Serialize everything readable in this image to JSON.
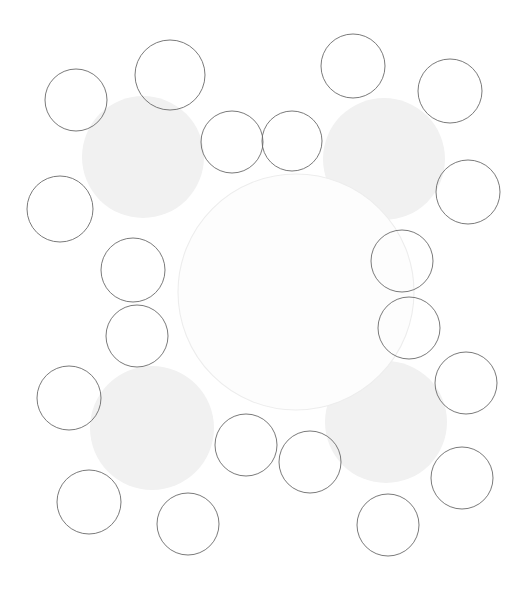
{
  "figure": {
    "type": "circle-packing-diagram",
    "width": 527,
    "height": 593,
    "background": "#ffffff",
    "stroke_color": "#6b6b6b",
    "stroke_width": 0.9,
    "fill_none": "none",
    "gray_fill": "#f1f1f1",
    "gray_stroke": "none",
    "center_stroke": "#ededed",
    "center_fill": "#fdfdfd"
  },
  "chart_data": {
    "type": "scatter",
    "title": "",
    "xlabel": "",
    "ylabel": "",
    "xlim": [
      0,
      527
    ],
    "ylim": [
      0,
      593
    ],
    "grid": false,
    "legend": null,
    "annotations": [],
    "series": [
      {
        "name": "central-circle",
        "style": "outline-faint",
        "points": [
          {
            "id": "c-center",
            "cx": 296,
            "cy": 292,
            "r": 118
          }
        ]
      },
      {
        "name": "gray-discs",
        "style": "filled-gray",
        "points": [
          {
            "id": "g-top-left",
            "cx": 143,
            "cy": 157,
            "r": 61
          },
          {
            "id": "g-top-right",
            "cx": 384,
            "cy": 159,
            "r": 61
          },
          {
            "id": "g-bottom-left",
            "cx": 152,
            "cy": 428,
            "r": 62
          },
          {
            "id": "g-bottom-right",
            "cx": 386,
            "cy": 422,
            "r": 61
          }
        ]
      },
      {
        "name": "outlined-circles",
        "style": "outline",
        "points": [
          {
            "id": "o-01",
            "cx": 76,
            "cy": 100,
            "r": 31
          },
          {
            "id": "o-02",
            "cx": 170,
            "cy": 75,
            "r": 35
          },
          {
            "id": "o-03",
            "cx": 353,
            "cy": 66,
            "r": 32
          },
          {
            "id": "o-04",
            "cx": 450,
            "cy": 91,
            "r": 32
          },
          {
            "id": "o-05",
            "cx": 232,
            "cy": 142,
            "r": 31
          },
          {
            "id": "o-06",
            "cx": 292,
            "cy": 141,
            "r": 30
          },
          {
            "id": "o-07",
            "cx": 60,
            "cy": 209,
            "r": 33
          },
          {
            "id": "o-08",
            "cx": 468,
            "cy": 192,
            "r": 32
          },
          {
            "id": "o-09",
            "cx": 133,
            "cy": 270,
            "r": 32
          },
          {
            "id": "o-10",
            "cx": 137,
            "cy": 336,
            "r": 31
          },
          {
            "id": "o-11",
            "cx": 402,
            "cy": 261,
            "r": 31
          },
          {
            "id": "o-12",
            "cx": 409,
            "cy": 328,
            "r": 31
          },
          {
            "id": "o-13",
            "cx": 69,
            "cy": 398,
            "r": 32
          },
          {
            "id": "o-14",
            "cx": 466,
            "cy": 383,
            "r": 31
          },
          {
            "id": "o-15",
            "cx": 246,
            "cy": 445,
            "r": 31
          },
          {
            "id": "o-16",
            "cx": 310,
            "cy": 462,
            "r": 31
          },
          {
            "id": "o-17",
            "cx": 462,
            "cy": 478,
            "r": 31
          },
          {
            "id": "o-18",
            "cx": 89,
            "cy": 502,
            "r": 32
          },
          {
            "id": "o-19",
            "cx": 188,
            "cy": 524,
            "r": 31
          },
          {
            "id": "o-20",
            "cx": 388,
            "cy": 525,
            "r": 31
          }
        ]
      }
    ]
  }
}
